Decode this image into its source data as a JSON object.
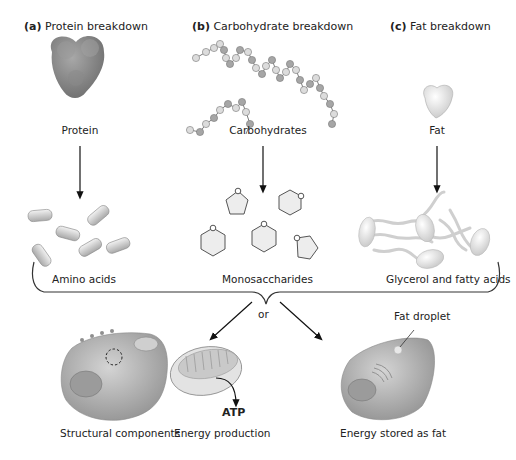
{
  "headers": [
    {
      "letter": "(a)",
      "title": "Protein breakdown"
    },
    {
      "letter": "(b)",
      "title": "Carbohydrate breakdown"
    },
    {
      "letter": "(c)",
      "title": "Fat breakdown"
    }
  ],
  "sources": {
    "protein": "Protein",
    "carbohydrates": "Carbohydrates",
    "fat": "Fat"
  },
  "products": {
    "amino_acids": "Amino acids",
    "monosaccharides": "Monosaccharides",
    "glycerol_fatty_acids": "Glycerol and fatty acids"
  },
  "branch_label": "or",
  "fat_droplet_label": "Fat droplet",
  "atp_label": "ATP",
  "outcomes": {
    "structural": "Structural components",
    "energy_production": "Energy production",
    "energy_stored": "Energy stored as fat"
  },
  "colors": {
    "protein_fill": "#8c8c8c",
    "cell_fill": "#b5b5b5",
    "ring_stroke": "#555555",
    "arrow": "#111111"
  }
}
